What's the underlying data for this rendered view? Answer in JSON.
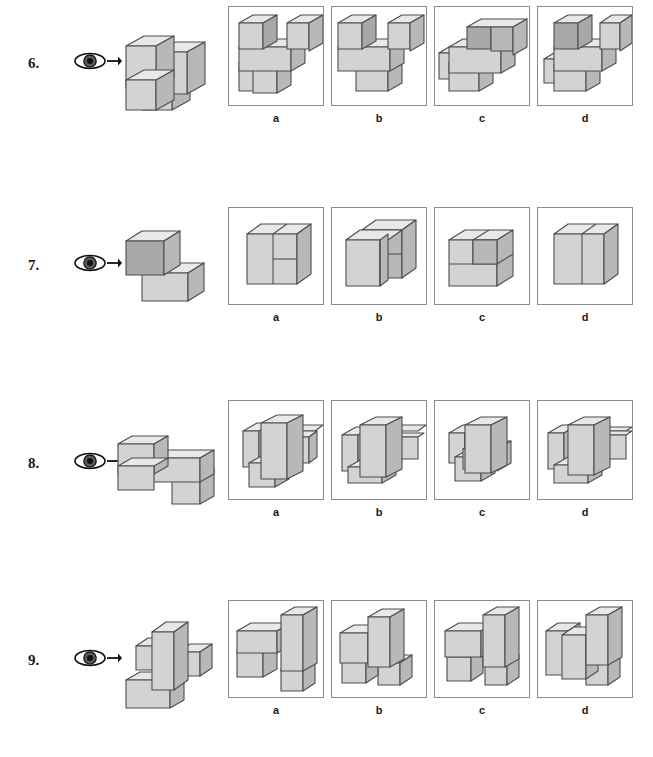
{
  "document": {
    "title": "Spatial Visualization Test - Block Rotation Items",
    "type": "printed-test-worksheet",
    "page_background": "#ffffff"
  },
  "colors": {
    "face_top": "#e8e8e8",
    "face_front": "#d3d3d3",
    "face_side": "#b8b8b8",
    "face_dark": "#a8a8a8",
    "outline": "#4d4d4d",
    "panel_border": "#8c8c8c",
    "text": "#1a1a1a",
    "eye_pupil": "#111111",
    "eye_iris": "#4a4a4a",
    "eye_white": "#ffffff"
  },
  "icons": {
    "eye": "eye-icon",
    "arrow": "arrow-right-icon"
  },
  "option_labels": [
    "a",
    "b",
    "c",
    "d"
  ],
  "questions": [
    {
      "number": "6.",
      "view_direction_label": "arrow points right from eye",
      "stimulus_description": "Staircase stack of three tall blocks rising left-to-right with a step at the base",
      "options": [
        {
          "label": "a",
          "description": "U-shaped arrangement: two tall uprights front-left and right with a low cube at lower left"
        },
        {
          "label": "b",
          "description": "U-shaped arrangement with front slab extending lower-right"
        },
        {
          "label": "c",
          "description": "Stepped arrangement with small block at left and long slab to the right"
        },
        {
          "label": "d",
          "description": "U-shaped arrangement with narrow left upright and thin step at lower left"
        }
      ]
    },
    {
      "number": "7.",
      "view_direction_label": "arrow points right from eye",
      "stimulus_description": "Two cubes: one on top-left, one lower-right forming an L step",
      "options": [
        {
          "label": "a",
          "description": "Cube block with vertical split and a horizontal line on the right half"
        },
        {
          "label": "b",
          "description": "Two offset cubes, front cube shifted left with notch on top"
        },
        {
          "label": "c",
          "description": "Wide block with top row split into two squares"
        },
        {
          "label": "d",
          "description": "Plain cube divided vertically into two faces"
        }
      ]
    },
    {
      "number": "8.",
      "view_direction_label": "arrow points right from eye",
      "stimulus_description": "One cube at the upper-left, a long horizontal slab to the right, and a cube dropping at the lower right",
      "options": [
        {
          "label": "a",
          "description": "Vertical slab centered with arm extending to the right and a block at lower left"
        },
        {
          "label": "b",
          "description": "Vertical slab with long arm to the right and flat base at lower left"
        },
        {
          "label": "c",
          "description": "Vertical slab with short arm and notch at lower middle"
        },
        {
          "label": "d",
          "description": "Vertical slab with long arm to the right and deeper left base"
        }
      ]
    },
    {
      "number": "9.",
      "view_direction_label": "arrow points right from eye",
      "stimulus_description": "Tall upright column in the middle with a horizontal slab at the base and a small cube at the right",
      "options": [
        {
          "label": "a",
          "description": "Tall upright at right with slab extending lower-left and cube at lower right"
        },
        {
          "label": "b",
          "description": "Tall upright at right with cubes stacked at the lower left and a cube lower right"
        },
        {
          "label": "c",
          "description": "Tall upright at right, slab to the left and isolated cube at lower right"
        },
        {
          "label": "d",
          "description": "Tall upright at right with two blocks at left and a cube at lower right"
        }
      ]
    }
  ]
}
